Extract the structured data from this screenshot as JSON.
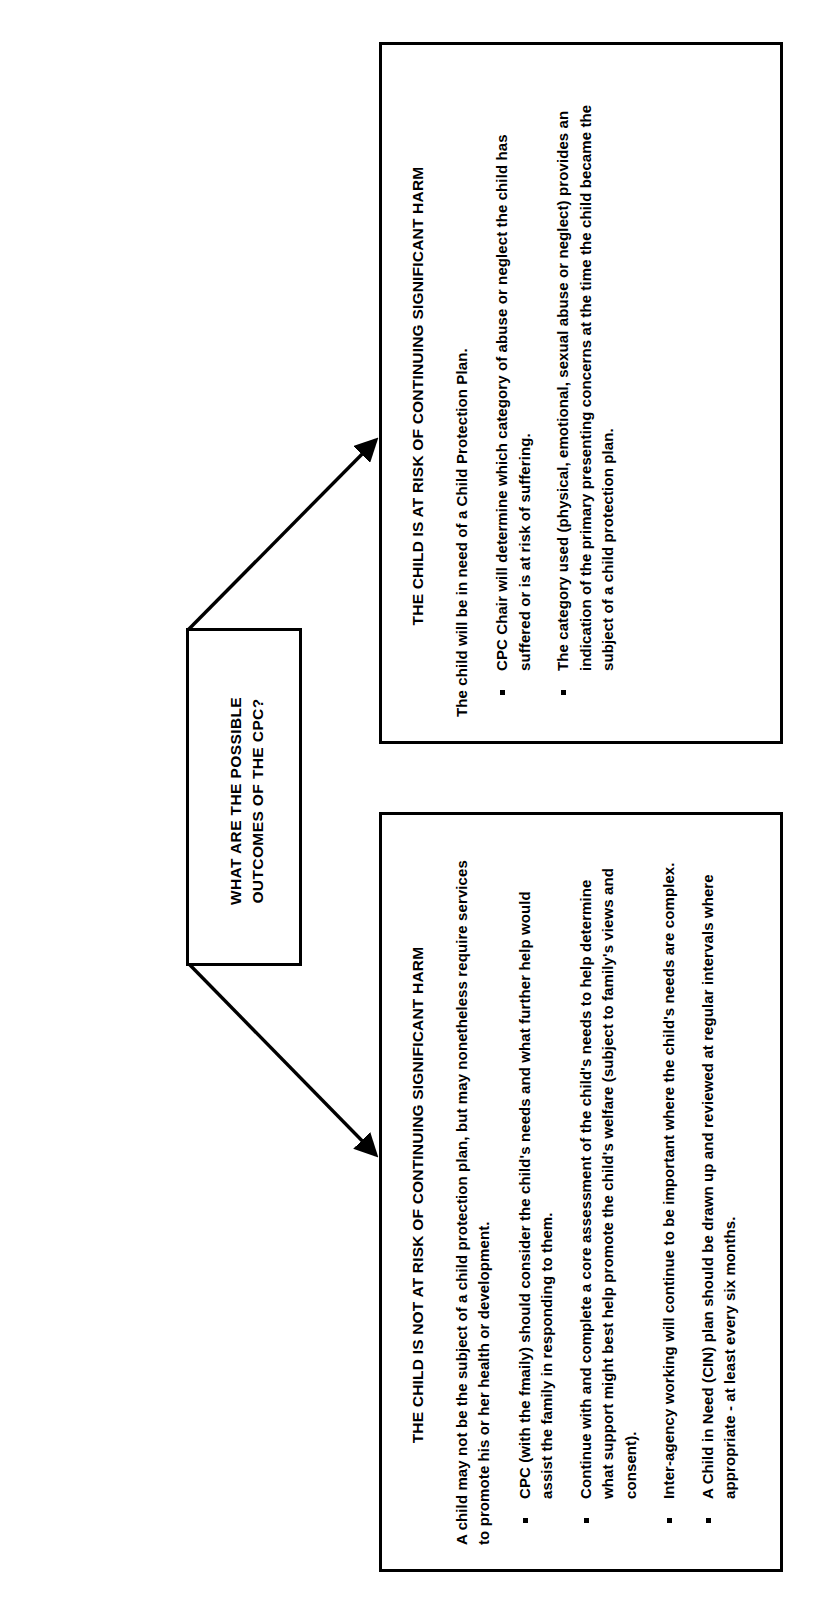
{
  "diagram": {
    "title_box": {
      "text": "WHAT ARE THE POSSIBLE OUTCOMES OF THE CPC?"
    },
    "branches": [
      {
        "id": "at-risk",
        "heading": "THE CHILD IS AT RISK OF CONTINUING SIGNIFICANT HARM",
        "intro": "The child will be in need of a Child Protection Plan.",
        "bullets": [
          "CPC Chair will determine which category of abuse or neglect the child has suffered or is at risk of suffering.",
          "The category used (physical, emotional, sexual abuse or neglect) provides an indication of the primary presenting concerns at the time the child became the subject of a child protection plan."
        ]
      },
      {
        "id": "not-at-risk",
        "heading": "THE CHILD IS NOT AT RISK OF CONTINUING SIGNIFICANT HARM",
        "intro": "A child may not be the subject of a child protection plan, but may nonetheless require services to promote his or her health or development.",
        "bullets": [
          "CPC (with the fmaily) should consider the child's needs and what further help would assist the family in responding to them.",
          "Continue with and complete a core assessment of the child's needs to help determine what support might best help promote the child's welfare (subject to family's views and consent).",
          "Inter-agency working will continue to be important where the child's needs are complex.",
          "A Child in Need (CIN) plan should be drawn up and reviewed at regular intervals where appropriate - at least every six months."
        ]
      }
    ],
    "colors": {
      "border": "#000000",
      "text": "#000000",
      "background": "#ffffff"
    }
  }
}
